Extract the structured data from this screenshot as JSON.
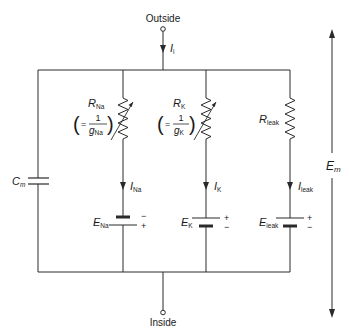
{
  "diagram": {
    "type": "equivalent-circuit",
    "terminals": {
      "top": "Outside",
      "bottom": "Inside"
    },
    "total_current": {
      "symbol": "I",
      "subscript": "i"
    },
    "membrane_potential": {
      "symbol": "E",
      "subscript": "m"
    },
    "capacitor": {
      "symbol": "C",
      "subscript": "m"
    },
    "branches": [
      {
        "id": "na",
        "resistor": {
          "symbol": "R",
          "subscript": "Na",
          "variable": true
        },
        "conductance_note": {
          "prefix": "=",
          "numerator": "1",
          "symbol": "g",
          "subscript": "Na"
        },
        "current": {
          "symbol": "I",
          "subscript": "Na"
        },
        "battery": {
          "symbol": "E",
          "subscript": "Na",
          "top_sign": "−",
          "bottom_sign": "+"
        }
      },
      {
        "id": "k",
        "resistor": {
          "symbol": "R",
          "subscript": "K",
          "variable": true
        },
        "conductance_note": {
          "prefix": "=",
          "numerator": "1",
          "symbol": "g",
          "subscript": "K"
        },
        "current": {
          "symbol": "I",
          "subscript": "K"
        },
        "battery": {
          "symbol": "E",
          "subscript": "K",
          "top_sign": "+",
          "bottom_sign": "−"
        }
      },
      {
        "id": "leak",
        "resistor": {
          "symbol": "R",
          "subscript": "leak",
          "variable": false
        },
        "current": {
          "symbol": "I",
          "subscript": "leak"
        },
        "battery": {
          "symbol": "E",
          "subscript": "leak",
          "top_sign": "+",
          "bottom_sign": "−"
        }
      }
    ],
    "colors": {
      "line": "#2a2a2a",
      "text": "#1a1a1a",
      "background": "#ffffff"
    }
  }
}
